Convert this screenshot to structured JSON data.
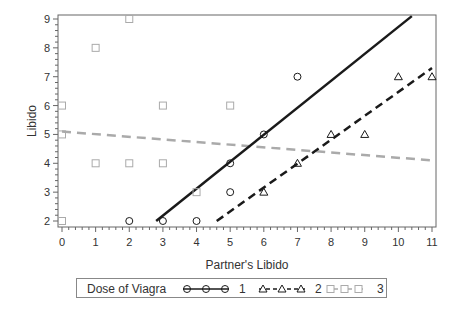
{
  "chart_data": {
    "type": "scatter",
    "title": "",
    "xlabel": "Partner's Libido",
    "ylabel": "Libido",
    "xlim": [
      0,
      11
    ],
    "ylim": [
      2,
      9
    ],
    "xticks": [
      "0",
      "1",
      "2",
      "3",
      "4",
      "5",
      "6",
      "7",
      "8",
      "9",
      "10",
      "11"
    ],
    "yticks": [
      "2",
      "3",
      "4",
      "5",
      "6",
      "7",
      "8",
      "9"
    ],
    "grid": false,
    "legend_position": "bottom",
    "legend_title": "Dose of Viagra",
    "series": [
      {
        "name": "1",
        "marker": "circle",
        "line_style": "solid",
        "color": "#1a1a1a",
        "points": [
          [
            2,
            2
          ],
          [
            3,
            2
          ],
          [
            4,
            2
          ],
          [
            5,
            3
          ],
          [
            5,
            4
          ],
          [
            6,
            5
          ],
          [
            7,
            7
          ]
        ],
        "fit_line": [
          [
            2.8,
            2.0
          ],
          [
            10.4,
            9.1
          ]
        ]
      },
      {
        "name": "2",
        "marker": "triangle",
        "line_style": "dashed",
        "color": "#1a1a1a",
        "points": [
          [
            6,
            3
          ],
          [
            7,
            4
          ],
          [
            8,
            5
          ],
          [
            9,
            5
          ],
          [
            10,
            7
          ],
          [
            11,
            7
          ]
        ],
        "fit_line": [
          [
            4.6,
            2.0
          ],
          [
            11.0,
            7.3
          ]
        ]
      },
      {
        "name": "3",
        "marker": "square",
        "line_style": "dashed",
        "color": "#aaaaaa",
        "points": [
          [
            0,
            2
          ],
          [
            0,
            5
          ],
          [
            0,
            6
          ],
          [
            1,
            4
          ],
          [
            1,
            8
          ],
          [
            2,
            4
          ],
          [
            2,
            9
          ],
          [
            3,
            4
          ],
          [
            3,
            6
          ],
          [
            4,
            3
          ],
          [
            5,
            6
          ]
        ],
        "fit_line": [
          [
            0,
            5.1
          ],
          [
            11,
            4.1
          ]
        ]
      }
    ]
  },
  "legend": {
    "title": "Dose of Viagra",
    "entries": [
      {
        "label": "1"
      },
      {
        "label": "2"
      },
      {
        "label": "3"
      }
    ]
  },
  "axes": {
    "xlabel": "Partner's Libido",
    "ylabel": "Libido"
  }
}
